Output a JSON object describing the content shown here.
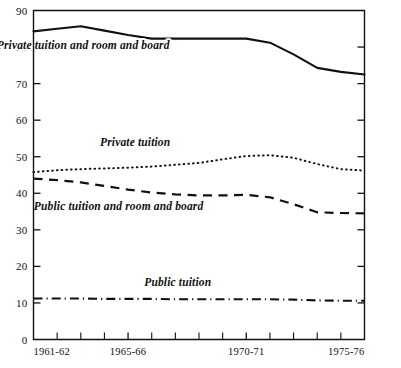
{
  "chart_data": {
    "type": "line",
    "title": "",
    "xlabel": "",
    "ylabel": "",
    "ylim": [
      0,
      90
    ],
    "ytick_values": [
      0,
      10,
      20,
      30,
      40,
      50,
      60,
      70,
      80,
      90
    ],
    "ytick_labels": [
      "0",
      "10",
      "20",
      "30",
      "40",
      "50",
      "60",
      "70",
      "80",
      "90"
    ],
    "grid": false,
    "legend_position": "inline-annotations",
    "x": [
      "1961-62",
      "1962-63",
      "1963-64",
      "1964-65",
      "1965-66",
      "1966-67",
      "1967-68",
      "1968-69",
      "1969-70",
      "1970-71",
      "1971-72",
      "1972-73",
      "1973-74",
      "1974-75",
      "1975-76"
    ],
    "xtick_labels_shown": [
      "1961-62",
      "1965-66",
      "1970-71",
      "1975-76"
    ],
    "xtick_label_indices": [
      0,
      4,
      9,
      14
    ],
    "series": [
      {
        "name": "Private tuition and room and board",
        "style": "solid",
        "label_x_index": 2.1,
        "label_y": 79.5,
        "values": [
          84.3,
          85.0,
          85.7,
          84.5,
          83.3,
          82.3,
          82.3,
          82.3,
          82.3,
          82.3,
          81.2,
          78.0,
          74.3,
          73.2,
          72.5
        ]
      },
      {
        "name": "Private tuition",
        "style": "dotted",
        "label_x_index": 4.3,
        "label_y": 53.0,
        "values": [
          45.8,
          46.3,
          46.6,
          46.8,
          47.0,
          47.3,
          47.8,
          48.3,
          49.3,
          50.2,
          50.4,
          49.7,
          48.0,
          46.6,
          46.2
        ]
      },
      {
        "name": "Public tuition and room and board",
        "style": "dashed",
        "label_x_index": 3.6,
        "label_y": 35.5,
        "values": [
          44.0,
          43.6,
          43.0,
          42.0,
          41.0,
          40.2,
          39.7,
          39.4,
          39.4,
          39.6,
          38.9,
          37.0,
          34.8,
          34.6,
          34.5
        ]
      },
      {
        "name": "Public tuition",
        "style": "dashdot",
        "label_x_index": 6.1,
        "label_y": 14.5,
        "values": [
          11.2,
          11.2,
          11.2,
          11.1,
          11.1,
          11.1,
          11.0,
          11.0,
          11.0,
          11.0,
          11.0,
          10.9,
          10.7,
          10.6,
          10.6
        ]
      }
    ]
  },
  "figure": {
    "background_color": "#ffffff",
    "ink_color": "#111111"
  }
}
